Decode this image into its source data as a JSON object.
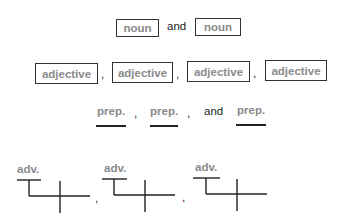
{
  "row_nouns": {
    "items": [
      "noun",
      "noun"
    ],
    "conjunction": "and"
  },
  "row_adjectives": {
    "items": [
      "adjective",
      "adjective",
      "adjective",
      "adjective"
    ],
    "separator": ","
  },
  "row_prepositions": {
    "items": [
      "prep.",
      "prep.",
      "prep."
    ],
    "separator": ",",
    "conjunction": "and"
  },
  "row_adverbs": {
    "items": [
      "adv.",
      "adv.",
      "adv."
    ],
    "separator": ","
  },
  "colors": {
    "placeholder_text": "#8a8a8a",
    "lines": "#222222"
  }
}
